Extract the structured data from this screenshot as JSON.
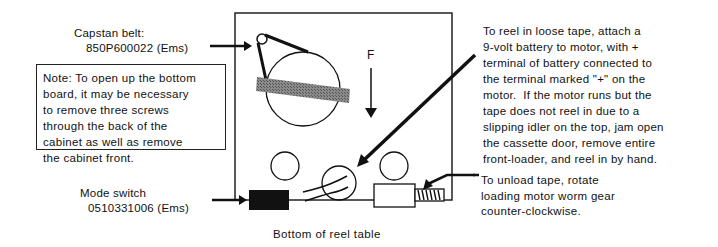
{
  "figure": {
    "caption": "Bottom of reel table",
    "direction_label": "F"
  },
  "callouts": {
    "capstan_belt": {
      "line1": "Capstan belt:",
      "line2": "850P600022 (Ems)"
    },
    "mode_switch": {
      "line1": "Mode switch",
      "line2": "0510331006 (Ems)"
    },
    "note": {
      "lines": [
        "Note: To open up the bottom",
        "board, it may be necessary",
        "to remove three screws",
        "through the back of the",
        "cabinet as well as remove",
        "the cabinet front."
      ]
    },
    "reel_in": {
      "lines": [
        "To reel in loose tape, attach a",
        "9-volt battery to motor, with +",
        "terminal of battery connected to",
        "the terminal marked \"+\" on the",
        "motor.  If the motor runs but the",
        "tape does not reel in due to a",
        "slipping idler on the top, jam open",
        "the cassette door, remove entire",
        "front-loader, and reel in by hand."
      ]
    },
    "unload": {
      "lines": [
        "To unload tape, rotate",
        "loading motor worm gear",
        "counter-clockwise."
      ]
    }
  },
  "colors": {
    "ink": "#111111",
    "belt_hatch": "#7a7a7a",
    "background": "#ffffff"
  }
}
